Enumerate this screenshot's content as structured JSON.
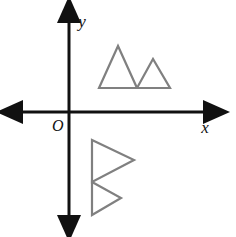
{
  "figure": {
    "background_color": "#ffffff",
    "axis_color": "#111111",
    "shape_color": "#808080",
    "shape_stroke_width": 2.2,
    "axis_stroke_width": 3
  },
  "labels": {
    "x_axis": "x",
    "y_axis": "y",
    "origin": "O"
  },
  "axes": {
    "origin_px": {
      "x": 69,
      "y": 112
    },
    "x_axis": {
      "name": "x-axis",
      "start_px": {
        "x": 10,
        "y": 112
      },
      "end_px": {
        "x": 216,
        "y": 112
      },
      "arrowheads": "both",
      "label_px": {
        "x": 205,
        "y": 133
      }
    },
    "y_axis": {
      "name": "y-axis",
      "start_px": {
        "x": 69,
        "y": 228
      },
      "end_px": {
        "x": 69,
        "y": 10
      },
      "arrowheads": "both",
      "label_px": {
        "x": 82,
        "y": 27
      }
    },
    "origin_label_px": {
      "x": 52,
      "y": 131
    }
  },
  "shapes": [
    {
      "name": "upper-figure",
      "description": "Pre-image: two triangles side by side above the x-axis in quadrant I",
      "quadrant": "I",
      "triangles": [
        {
          "name": "upper-large-triangle",
          "points": "99,88 118,46 137,88"
        },
        {
          "name": "upper-small-triangle",
          "points": "137,88 153,59 170,88"
        }
      ]
    },
    {
      "name": "lower-figure",
      "description": "Image: same two triangles rotated 90 degrees clockwise, below the x-axis in quadrant IV",
      "quadrant": "IV",
      "triangles": [
        {
          "name": "lower-large-triangle",
          "points": "92,140 134,160 92,182"
        },
        {
          "name": "lower-small-triangle",
          "points": "92,182 121,198 92,215"
        }
      ]
    }
  ]
}
